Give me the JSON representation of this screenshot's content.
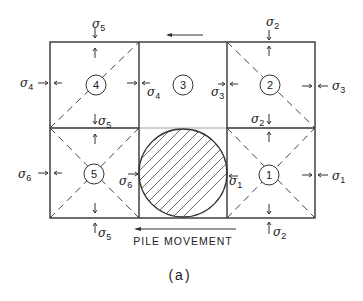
{
  "figure": {
    "label": "(a)",
    "movement_label": "PILE MOVEMENT",
    "cells": [
      {
        "id": "cell-1",
        "number": "1"
      },
      {
        "id": "cell-2",
        "number": "2"
      },
      {
        "id": "cell-3",
        "number": "3"
      },
      {
        "id": "cell-4",
        "number": "4"
      },
      {
        "id": "cell-5",
        "number": "5"
      }
    ],
    "stresses": {
      "sigma": "σ",
      "s1": "1",
      "s2": "2",
      "s3": "3",
      "s4": "4",
      "s5": "5",
      "s6": "6"
    },
    "colors": {
      "line": "#333333",
      "background": "#ffffff"
    }
  }
}
